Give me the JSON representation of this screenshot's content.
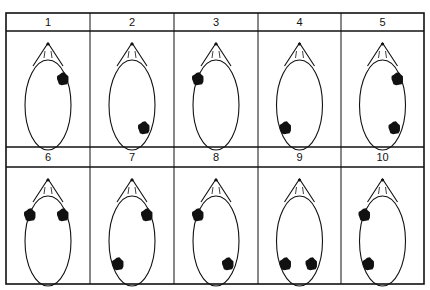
{
  "figure": {
    "colors": {
      "ink": "#111111",
      "background": "#ffffff"
    },
    "panels": [
      {
        "label": "1",
        "spots": [
          {
            "pos": "upper-right"
          }
        ]
      },
      {
        "label": "2",
        "spots": [
          {
            "pos": "lower-right"
          }
        ]
      },
      {
        "label": "3",
        "spots": [
          {
            "pos": "upper-left"
          }
        ]
      },
      {
        "label": "4",
        "spots": [
          {
            "pos": "lower-left"
          }
        ]
      },
      {
        "label": "5",
        "spots": [
          {
            "pos": "upper-right"
          },
          {
            "pos": "lower-right"
          }
        ]
      },
      {
        "label": "6",
        "spots": [
          {
            "pos": "upper-left"
          },
          {
            "pos": "upper-right"
          }
        ]
      },
      {
        "label": "7",
        "spots": [
          {
            "pos": "upper-right"
          },
          {
            "pos": "lower-left"
          }
        ]
      },
      {
        "label": "8",
        "spots": [
          {
            "pos": "upper-left"
          },
          {
            "pos": "lower-right"
          }
        ]
      },
      {
        "label": "9",
        "spots": [
          {
            "pos": "lower-left"
          },
          {
            "pos": "lower-right"
          }
        ]
      },
      {
        "label": "10",
        "spots": [
          {
            "pos": "upper-left"
          },
          {
            "pos": "lower-left"
          }
        ]
      }
    ]
  }
}
